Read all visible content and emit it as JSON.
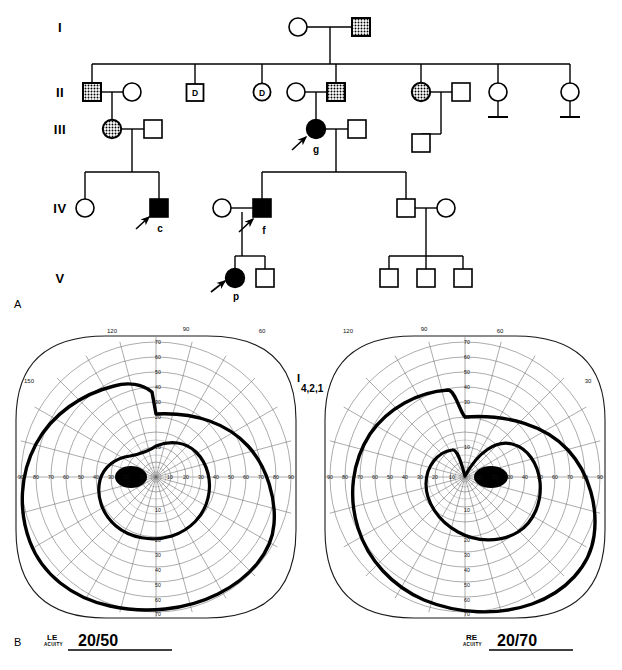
{
  "figure": {
    "panel_a_letter": "A",
    "panel_b_letter": "B",
    "caption": ""
  },
  "pedigree": {
    "generations": [
      {
        "label": "I"
      },
      {
        "label": "II"
      },
      {
        "label": "III"
      },
      {
        "label": "IV"
      },
      {
        "label": "V"
      }
    ],
    "deceased_marker": "D",
    "legend_meaning": {
      "open_square": "unaffected male",
      "open_circle": "unaffected female",
      "stippled_square": "carrier male",
      "stippled_circle": "carrier female",
      "filled_square": "affected male",
      "filled_circle": "affected female",
      "D_marker": "deceased"
    },
    "individuals": [
      {
        "id": "I-1",
        "gen": "I",
        "sex": "female",
        "status": "open",
        "x": 298,
        "y": 27,
        "label": ""
      },
      {
        "id": "I-2",
        "gen": "I",
        "sex": "male",
        "status": "stippled",
        "x": 361,
        "y": 27,
        "label": ""
      },
      {
        "id": "II-1",
        "gen": "II",
        "sex": "male",
        "status": "stippled",
        "x": 92,
        "y": 92,
        "label": ""
      },
      {
        "id": "II-2",
        "gen": "II",
        "sex": "female",
        "status": "open",
        "x": 132,
        "y": 92,
        "label": ""
      },
      {
        "id": "II-3",
        "gen": "II",
        "sex": "male",
        "status": "deceased",
        "x": 195,
        "y": 92,
        "label": "D"
      },
      {
        "id": "II-4",
        "gen": "II",
        "sex": "female",
        "status": "deceased",
        "x": 262,
        "y": 92,
        "label": "D"
      },
      {
        "id": "II-5",
        "gen": "II",
        "sex": "female",
        "status": "open",
        "x": 296,
        "y": 92,
        "label": ""
      },
      {
        "id": "II-6",
        "gen": "II",
        "sex": "male",
        "status": "stippled",
        "x": 336,
        "y": 92,
        "label": ""
      },
      {
        "id": "II-7",
        "gen": "II",
        "sex": "female",
        "status": "stippled",
        "x": 421,
        "y": 92,
        "label": ""
      },
      {
        "id": "II-8",
        "gen": "II",
        "sex": "male",
        "status": "open",
        "x": 461,
        "y": 92,
        "label": ""
      },
      {
        "id": "II-9",
        "gen": "II",
        "sex": "female",
        "status": "open",
        "x": 498,
        "y": 92,
        "label": ""
      },
      {
        "id": "II-10",
        "gen": "II",
        "sex": "female",
        "status": "open",
        "x": 570,
        "y": 92,
        "label": ""
      },
      {
        "id": "III-1",
        "gen": "III",
        "sex": "female",
        "status": "stippled",
        "x": 112,
        "y": 129,
        "label": ""
      },
      {
        "id": "III-2",
        "gen": "III",
        "sex": "male",
        "status": "open",
        "x": 153,
        "y": 129,
        "label": ""
      },
      {
        "id": "III-3",
        "gen": "III",
        "sex": "female",
        "status": "affected",
        "x": 316,
        "y": 129,
        "label": "g"
      },
      {
        "id": "III-4",
        "gen": "III",
        "sex": "male",
        "status": "open",
        "x": 357,
        "y": 129,
        "label": ""
      },
      {
        "id": "III-5",
        "gen": "III",
        "sex": "male",
        "status": "open",
        "x": 421,
        "y": 143,
        "label": ""
      },
      {
        "id": "IV-1",
        "gen": "IV",
        "sex": "female",
        "status": "open",
        "x": 85,
        "y": 208,
        "label": ""
      },
      {
        "id": "IV-2",
        "gen": "IV",
        "sex": "male",
        "status": "affected",
        "x": 159,
        "y": 208,
        "label": "c"
      },
      {
        "id": "IV-3",
        "gen": "IV",
        "sex": "female",
        "status": "open",
        "x": 222,
        "y": 208,
        "label": ""
      },
      {
        "id": "IV-4",
        "gen": "IV",
        "sex": "male",
        "status": "affected",
        "x": 262,
        "y": 208,
        "label": "f"
      },
      {
        "id": "IV-5",
        "gen": "IV",
        "sex": "male",
        "status": "open",
        "x": 406,
        "y": 208,
        "label": ""
      },
      {
        "id": "IV-6",
        "gen": "IV",
        "sex": "female",
        "status": "open",
        "x": 446,
        "y": 208,
        "label": ""
      },
      {
        "id": "V-1",
        "gen": "V",
        "sex": "female",
        "status": "affected",
        "x": 235,
        "y": 278,
        "label": "p"
      },
      {
        "id": "V-2",
        "gen": "V",
        "sex": "male",
        "status": "open",
        "x": 265,
        "y": 278,
        "label": ""
      },
      {
        "id": "V-3",
        "gen": "V",
        "sex": "male",
        "status": "open",
        "x": 389,
        "y": 278,
        "label": ""
      },
      {
        "id": "V-4",
        "gen": "V",
        "sex": "male",
        "status": "open",
        "x": 426,
        "y": 278,
        "label": ""
      },
      {
        "id": "V-5",
        "gen": "V",
        "sex": "male",
        "status": "open",
        "x": 463,
        "y": 278,
        "label": ""
      }
    ],
    "proband_arrows": [
      "c",
      "f",
      "g",
      "p"
    ]
  },
  "visual_fields": {
    "isopter_label_top": "I",
    "isopter_label_bottom": "4,2,1",
    "angle_ticks": [
      "120",
      "90",
      "60",
      "150",
      "30"
    ],
    "radial_ticks_horizontal": [
      "90",
      "80",
      "70",
      "60",
      "50",
      "40",
      "30",
      "20",
      "10",
      "10",
      "20",
      "30",
      "40",
      "50",
      "60",
      "70",
      "80",
      "90"
    ],
    "radial_ticks_vertical": [
      "70",
      "60",
      "50",
      "40",
      "30",
      "20",
      "10",
      "10",
      "20",
      "30",
      "40",
      "50",
      "60",
      "70"
    ],
    "left_eye": {
      "eye_label": "LE",
      "acuity_word": "ACUITY",
      "acuity_value": "20/50",
      "angle_labels": [
        {
          "text": "150",
          "x": 29,
          "y": 381
        },
        {
          "text": "120",
          "x": 112,
          "y": 330
        },
        {
          "text": "90",
          "x": 186,
          "y": 328
        },
        {
          "text": "60",
          "x": 262,
          "y": 330
        }
      ],
      "outer_isopter_extent_deg": {
        "temporal": 90,
        "nasal": 60,
        "superior": 60,
        "inferior": 65
      },
      "inner_isopter_extent_deg": {
        "temporal": 32,
        "nasal": 22,
        "superior": 13,
        "inferior": 22
      },
      "blind_spot_center_deg": {
        "x": -16,
        "y": 0
      }
    },
    "right_eye": {
      "eye_label": "RE",
      "acuity_word": "ACUITY",
      "acuity_value": "20/70",
      "angle_labels": [
        {
          "text": "120",
          "x": 348,
          "y": 330
        },
        {
          "text": "90",
          "x": 424,
          "y": 328
        },
        {
          "text": "60",
          "x": 500,
          "y": 330
        },
        {
          "text": "30",
          "x": 584,
          "y": 381
        }
      ],
      "outer_isopter_extent_deg": {
        "temporal": 90,
        "nasal": 60,
        "superior": 57,
        "inferior": 62
      },
      "inner_isopter_extent_deg": {
        "temporal": 32,
        "nasal": 22,
        "superior": 14,
        "inferior": 22
      },
      "blind_spot_center_deg": {
        "x": 16,
        "y": 0
      }
    }
  }
}
